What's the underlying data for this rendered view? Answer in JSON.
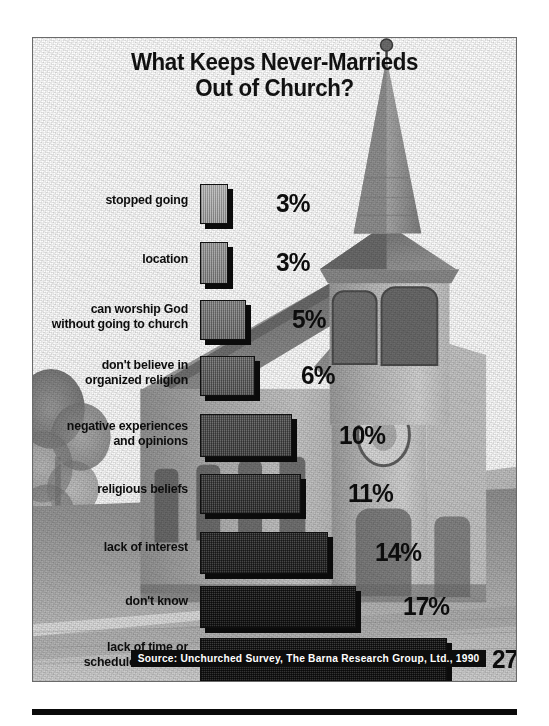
{
  "title": {
    "line1": "What Keeps Never-Marrieds",
    "line2": "Out of Church?"
  },
  "source": "Source: Unchurched Survey, The Barna Research Group, Ltd.,   1990",
  "colors": {
    "ink": "#0d0d0d",
    "frame": "#6a6a6a",
    "bar_outline": "#101010",
    "bar_shadow": "#0b0b0b",
    "caption_background": "#0d0d0d",
    "caption_text": "#ffffff",
    "page_background": "#ffffff"
  },
  "chart_data": {
    "type": "bar",
    "orientation": "horizontal",
    "title": "What Keeps Never-Marrieds Out of Church?",
    "xlabel": "",
    "ylabel": "",
    "unit": "%",
    "xlim": [
      0,
      27
    ],
    "grid": false,
    "legend": false,
    "source": "Source: Unchurched Survey, The Barna Research Group, Ltd.,   1990",
    "categories": [
      "stopped going",
      "location",
      "can worship God\nwithout going to church",
      "don't believe in\norganized religion",
      "negative experiences\nand opinions",
      "religious beliefs",
      "lack of interest",
      "don't know",
      "lack of time or\nschedule conflicts"
    ],
    "values": [
      3,
      3,
      5,
      6,
      10,
      11,
      14,
      17,
      27
    ],
    "value_labels": [
      "3%",
      "3%",
      "5%",
      "6%",
      "10%",
      "11%",
      "14%",
      "17%",
      "27%"
    ]
  },
  "bars": [
    {
      "label": "stopped going",
      "value": 3,
      "value_label": "3%",
      "top": 146,
      "height": 40,
      "width": 28,
      "label_top": 155,
      "pct_left": 243
    },
    {
      "label": "location",
      "value": 3,
      "value_label": "3%",
      "top": 204,
      "height": 42,
      "width": 28,
      "label_top": 214,
      "pct_left": 243
    },
    {
      "label": "can worship God\nwithout going to church",
      "value": 5,
      "value_label": "5%",
      "top": 262,
      "height": 40,
      "width": 46,
      "label_top": 264,
      "pct_left": 259
    },
    {
      "label": "don't believe in\norganized religion",
      "value": 6,
      "value_label": "6%",
      "top": 318,
      "height": 40,
      "width": 55,
      "label_top": 320,
      "pct_left": 268
    },
    {
      "label": "negative experiences\nand opinions",
      "value": 10,
      "value_label": "10%",
      "top": 376,
      "height": 43,
      "width": 92,
      "label_top": 381,
      "pct_left": 306
    },
    {
      "label": "religious beliefs",
      "value": 11,
      "value_label": "11%",
      "top": 436,
      "height": 40,
      "width": 101,
      "label_top": 444,
      "pct_left": 315
    },
    {
      "label": "lack of interest",
      "value": 14,
      "value_label": "14%",
      "top": 494,
      "height": 42,
      "width": 128,
      "label_top": 502,
      "pct_left": 342
    },
    {
      "label": "don't know",
      "value": 17,
      "value_label": "17%",
      "top": 548,
      "height": 42,
      "width": 156,
      "label_top": 556,
      "pct_left": 370
    },
    {
      "label": "lack of time or\nschedule conflicts",
      "value": 27,
      "value_label": "27%",
      "top": 600,
      "height": 44,
      "width": 247,
      "label_top": 602,
      "pct_left": 459
    }
  ]
}
